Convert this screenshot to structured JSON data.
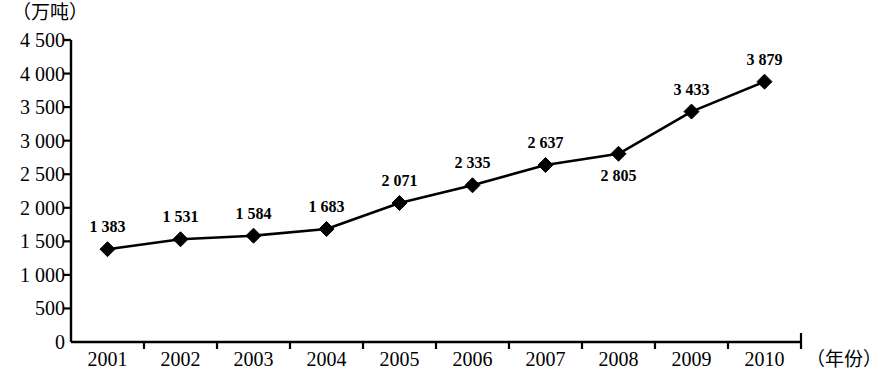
{
  "chart_data": {
    "type": "line",
    "title": "",
    "subtitle": "",
    "xlabel": "（年份）",
    "ylabel": "（万吨）",
    "categories": [
      "2001",
      "2002",
      "2003",
      "2004",
      "2005",
      "2006",
      "2007",
      "2008",
      "2009",
      "2010"
    ],
    "values": [
      1383,
      1531,
      1584,
      1683,
      2071,
      2335,
      2637,
      2805,
      3433,
      3879
    ],
    "value_labels": [
      "1 383",
      "1 531",
      "1 584",
      "1 683",
      "2 071",
      "2 335",
      "2 637",
      "2 805",
      "3 433",
      "3 879"
    ],
    "label_positions": [
      "above",
      "above",
      "above",
      "above",
      "above",
      "above",
      "above",
      "below",
      "above",
      "above"
    ],
    "ylim": [
      0,
      4500
    ],
    "ytick_values": [
      0,
      500,
      1000,
      1500,
      2000,
      2500,
      3000,
      3500,
      4000,
      4500
    ],
    "ytick_labels": [
      "0",
      "500",
      "1 000",
      "1 500",
      "2 000",
      "2 500",
      "3 000",
      "3 500",
      "4 000",
      "4 500"
    ],
    "grid": false,
    "legend": null,
    "series_color": "#000000",
    "marker": "diamond"
  }
}
